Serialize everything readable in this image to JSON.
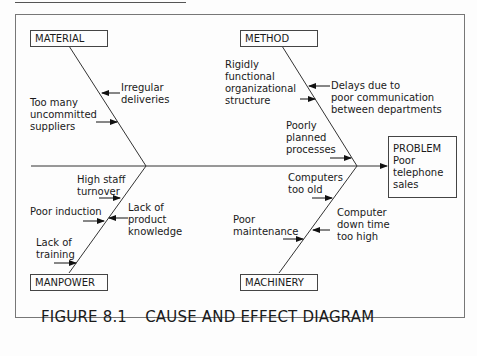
{
  "diagram": {
    "type": "fishbone",
    "problem": {
      "title": "PROBLEM",
      "line1": "Poor",
      "line2": "telephone",
      "line3": "sales"
    },
    "categories": {
      "material": {
        "label": "MATERIAL",
        "causes": [
          {
            "text": "Irregular\ndeliveries"
          },
          {
            "text": "Too many\nuncommitted\nsuppliers"
          }
        ]
      },
      "method": {
        "label": "METHOD",
        "causes": [
          {
            "text": "Rigidly\nfunctional\norganizational\nstructure"
          },
          {
            "text": "Delays due to\npoor communication\nbetween departments"
          },
          {
            "text": "Poorly\nplanned\nprocesses"
          }
        ]
      },
      "manpower": {
        "label": "MANPOWER",
        "causes": [
          {
            "text": "High staff\nturnover"
          },
          {
            "text": "Poor induction"
          },
          {
            "text": "Lack of\nproduct\nknowledge"
          },
          {
            "text": "Lack of\ntraining"
          }
        ]
      },
      "machinery": {
        "label": "MACHINERY",
        "causes": [
          {
            "text": "Computers\ntoo old"
          },
          {
            "text": "Computer\ndown time\ntoo high"
          },
          {
            "text": "Poor\nmaintenance"
          }
        ]
      }
    }
  },
  "caption": {
    "figure": "FIGURE 8.1",
    "title": "CAUSE AND EFFECT DIAGRAM"
  }
}
